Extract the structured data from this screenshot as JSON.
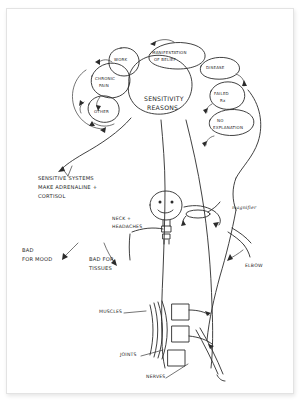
{
  "page": {
    "background_color": "#ffffff",
    "ink_color": "#2b2b2b",
    "width": 303,
    "height": 403
  },
  "central_node": {
    "line1": "SENSITIVITY",
    "line2": "REASONS"
  },
  "bubbles": [
    {
      "id": "work",
      "label": "WORK",
      "x": 120,
      "y": 60,
      "rx": 15,
      "ry": 13
    },
    {
      "id": "manifestation",
      "label_line1": "MANIFESTATION",
      "label_line2": "OF BELIEF",
      "x": 172,
      "y": 57,
      "rx": 26,
      "ry": 12
    },
    {
      "id": "disease",
      "label": "DISEASE",
      "x": 219,
      "y": 69,
      "rx": 20,
      "ry": 11
    },
    {
      "id": "chronic_pain",
      "label_line1": "CHRONIC",
      "label_line2": "PAIN",
      "x": 105,
      "y": 82,
      "rx": 18,
      "ry": 15
    },
    {
      "id": "failed_rx",
      "label_line1": "FAILED",
      "label_line2": "Rx",
      "x": 225,
      "y": 96,
      "rx": 17,
      "ry": 13
    },
    {
      "id": "other",
      "label": "OTHER",
      "x": 100,
      "y": 110,
      "rx": 14,
      "ry": 12
    },
    {
      "id": "no_explanation",
      "label_line1": "NO",
      "label_line2": "EXPLANATION",
      "x": 230,
      "y": 124,
      "rx": 22,
      "ry": 12
    }
  ],
  "annotations": {
    "sensitive_systems": {
      "line1": "SENSITIVE  SYSTEMS",
      "line2": "MAKE  ADRENALINE +",
      "line3": "CORTISOL"
    },
    "bad_for_mood": {
      "line1": "BAD",
      "line2": "FOR MOOD"
    },
    "bad_for_tissues": {
      "line1": "BAD FOR",
      "line2": "TISSUES"
    },
    "neck_headaches": {
      "line1": "NECK +",
      "line2": "HEADACHES"
    },
    "magnifier": "magnifier",
    "elbow": "ELBOW",
    "muscles": "MUSCLES",
    "joints": "JOINTS",
    "nerves": "NERVES"
  }
}
